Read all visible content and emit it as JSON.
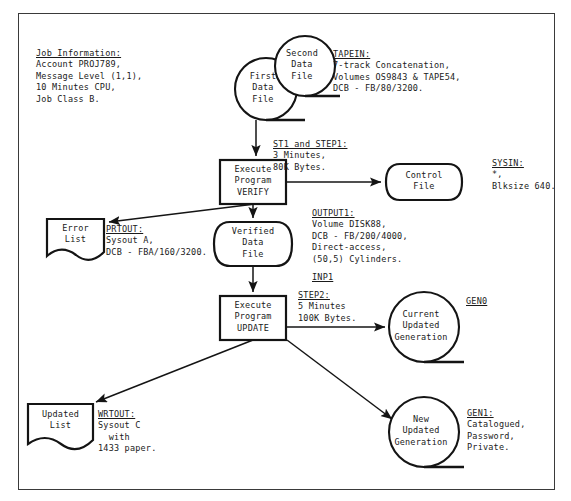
{
  "diagram": {
    "frame": {
      "x": 18,
      "y": 13,
      "w": 535,
      "h": 475
    }
  },
  "annotations": [
    {
      "id": "job-information",
      "heading": "Job Information:",
      "lines": [
        "Account PROJ789,",
        "Message Level (1,1),",
        "10 Minutes CPU,",
        "Job Class B."
      ],
      "x": 36,
      "y": 48
    },
    {
      "id": "tapein",
      "heading": "TAPEIN:",
      "lines": [
        "7-track Concatenation,",
        "Volumes OS9843 & TAPE54,",
        "DCB - FB/80/3200."
      ],
      "x": 333,
      "y": 49
    },
    {
      "id": "st1-step1",
      "heading": "ST1 and STEP1:",
      "lines": [
        "3 Minutes,",
        "80K Bytes."
      ],
      "x": 273,
      "y": 139
    },
    {
      "id": "sysin",
      "heading": "SYSIN:",
      "lines": [
        "*,",
        "Blksize 640."
      ],
      "x": 492,
      "y": 158
    },
    {
      "id": "prtout",
      "heading": "PRTOUT:",
      "lines": [
        "Sysout A,",
        "DCB - FBA/160/3200."
      ],
      "x": 106,
      "y": 224
    },
    {
      "id": "output1",
      "heading": "OUTPUT1:",
      "lines": [
        "Volume DISK88,",
        "DCB - FB/200/4000,",
        "Direct-access,",
        "(50,5) Cylinders."
      ],
      "x": 312,
      "y": 208
    },
    {
      "id": "inp1",
      "heading": "INP1",
      "lines": [],
      "x": 312,
      "y": 272
    },
    {
      "id": "step2",
      "heading": "STEP2:",
      "lines": [
        "5 Minutes",
        "100K Bytes."
      ],
      "x": 298,
      "y": 290
    },
    {
      "id": "gen0",
      "heading": "GEN0",
      "lines": [],
      "x": 466,
      "y": 296
    },
    {
      "id": "gen1",
      "heading": "GEN1:",
      "lines": [
        "Catalogued,",
        "Password,",
        "Private."
      ],
      "x": 467,
      "y": 408
    },
    {
      "id": "wrtout",
      "heading": "WRTOUT:",
      "lines": [
        "Sysout C",
        "  with",
        "1433 paper."
      ],
      "x": 98,
      "y": 409
    }
  ],
  "nodes": [
    {
      "id": "first-data-file",
      "kind": "tape",
      "lines": [
        "First",
        "Data",
        "File"
      ],
      "cx": 266,
      "cy": 89,
      "r": 31
    },
    {
      "id": "second-data-file",
      "kind": "tape",
      "lines": [
        "Second",
        "Data",
        "File"
      ],
      "cx": 305,
      "cy": 66,
      "r": 30
    },
    {
      "id": "execute-verify",
      "kind": "process",
      "lines": [
        "Execute",
        "Program",
        "VERIFY"
      ],
      "x": 220,
      "y": 160,
      "w": 66,
      "h": 44
    },
    {
      "id": "control-file",
      "kind": "disk",
      "lines": [
        "Control",
        "File"
      ],
      "x": 388,
      "y": 164,
      "w": 72,
      "h": 36
    },
    {
      "id": "error-list",
      "kind": "doc",
      "lines": [
        "Error",
        "List"
      ],
      "x": 47,
      "y": 219,
      "w": 57,
      "h": 40
    },
    {
      "id": "verified-file",
      "kind": "disk",
      "lines": [
        "Verified",
        "Data",
        "File"
      ],
      "x": 216,
      "y": 222,
      "w": 74,
      "h": 44
    },
    {
      "id": "execute-update",
      "kind": "process",
      "lines": [
        "Execute",
        "Program",
        "UPDATE"
      ],
      "x": 220,
      "y": 296,
      "w": 66,
      "h": 44
    },
    {
      "id": "current-gen",
      "kind": "tape",
      "lines": [
        "Current",
        "Updated",
        "Generation"
      ],
      "cx": 424,
      "cy": 327,
      "r": 35
    },
    {
      "id": "new-gen",
      "kind": "tape",
      "lines": [
        "New",
        "Updated",
        "Generation"
      ],
      "cx": 424,
      "cy": 432,
      "r": 35
    },
    {
      "id": "updated-list",
      "kind": "doc",
      "lines": [
        "Updated",
        "List"
      ],
      "x": 28,
      "y": 404,
      "w": 65,
      "h": 42
    }
  ],
  "connectors": [
    {
      "id": "first-file-to-verify",
      "from": "first-data-file",
      "to": "execute-verify"
    },
    {
      "id": "verify-to-control-file",
      "from": "execute-verify",
      "to": "control-file"
    },
    {
      "id": "verify-to-error-list",
      "from": "execute-verify",
      "to": "error-list"
    },
    {
      "id": "verify-to-verified",
      "from": "execute-verify",
      "to": "verified-file"
    },
    {
      "id": "verified-to-update",
      "from": "verified-file",
      "to": "execute-update"
    },
    {
      "id": "update-to-current-gen",
      "from": "execute-update",
      "to": "current-gen"
    },
    {
      "id": "update-to-new-gen",
      "from": "execute-update",
      "to": "new-gen"
    },
    {
      "id": "update-to-updated-list",
      "from": "execute-update",
      "to": "updated-list"
    }
  ],
  "colors": {
    "ink": "#141414",
    "frame": "#3a3a3a",
    "paper": "#ffffff"
  }
}
